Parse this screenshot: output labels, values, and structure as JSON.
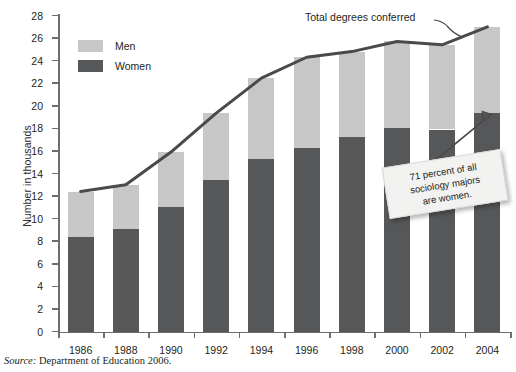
{
  "chart_data": {
    "type": "bar",
    "subtype": "stacked-bar-with-line-overlay",
    "title": "",
    "xlabel": "",
    "ylabel": "Number in thousands",
    "ylim": [
      0,
      28
    ],
    "ytick_step": 2,
    "yticks": [
      0,
      2,
      4,
      6,
      8,
      10,
      12,
      14,
      16,
      18,
      20,
      22,
      24,
      26,
      28
    ],
    "grid": false,
    "legend_position": "upper-left-inside",
    "categories": [
      "1986",
      "1988",
      "1990",
      "1992",
      "1994",
      "1996",
      "1998",
      "2000",
      "2002",
      "2004"
    ],
    "series": [
      {
        "name": "Women",
        "color": "#565759",
        "values": [
          8.4,
          9.05,
          11.0,
          13.4,
          15.3,
          16.3,
          17.2,
          18.0,
          17.9,
          19.4
        ]
      },
      {
        "name": "Men",
        "color": "#c6c7c6",
        "values": [
          4.0,
          3.95,
          4.9,
          5.95,
          7.15,
          8.0,
          7.6,
          7.7,
          7.5,
          7.6
        ]
      }
    ],
    "line_series": {
      "name": "Total degrees conferred",
      "color": "#4a4a4c",
      "values": [
        12.4,
        13.0,
        15.9,
        19.35,
        22.45,
        24.3,
        24.8,
        25.7,
        25.4,
        27.0
      ]
    },
    "annotations": [
      {
        "id": "note",
        "text_lines": [
          "71 percent of all",
          "sociology majors",
          "are women."
        ],
        "points_to": "2004 women segment"
      },
      {
        "id": "line-label",
        "text": "Total degrees conferred",
        "points_to": "total line at 2002"
      }
    ]
  },
  "legend": {
    "items": [
      {
        "label": "Men",
        "color": "#c6c7c6"
      },
      {
        "label": "Women",
        "color": "#565759"
      }
    ]
  },
  "axis": {
    "y_label": "Number in thousands"
  },
  "line_label": "Total degrees conferred",
  "note": {
    "line1": "71 percent of all",
    "line2": "sociology majors",
    "line3": "are women."
  },
  "source": {
    "prefix": "Source:",
    "text": "Department of Education 2006."
  },
  "colors": {
    "men": "#c6c7c6",
    "women": "#565759",
    "line": "#4a4a4c",
    "axis": "#6e6e6e",
    "text": "#231f20"
  }
}
